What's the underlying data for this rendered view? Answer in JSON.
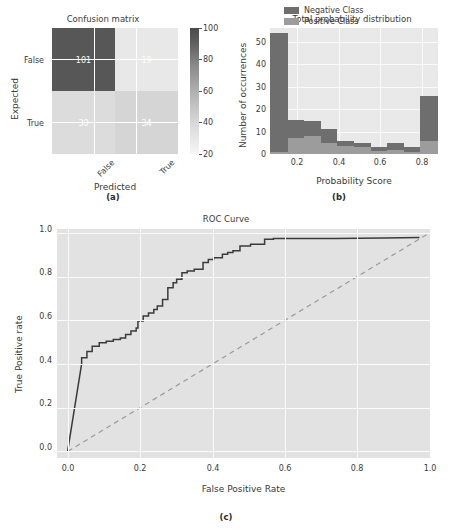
{
  "figure": {
    "captions": {
      "a": "(a)",
      "b": "(b)",
      "c": "(c)"
    }
  },
  "chart_data": [
    {
      "type": "heatmap",
      "panel": "a",
      "title": "Confusion matrix",
      "xlabel": "Predicted",
      "ylabel": "Expected",
      "xticklabels": [
        "False",
        "True"
      ],
      "yticklabels": [
        "False",
        "True"
      ],
      "matrix": [
        [
          101,
          19
        ],
        [
          30,
          34
        ]
      ],
      "cells": [
        {
          "row": "False",
          "col": "False",
          "value": 101,
          "color": "#575757"
        },
        {
          "row": "False",
          "col": "True",
          "value": 19,
          "color": "#e8e8e8"
        },
        {
          "row": "True",
          "col": "False",
          "value": 30,
          "color": "#dcdcdc"
        },
        {
          "row": "True",
          "col": "True",
          "value": 34,
          "color": "#d5d5d5"
        }
      ],
      "colorbar": {
        "ticks": [
          20,
          40,
          60,
          80,
          100
        ],
        "ticklabels": [
          "20",
          "40",
          "60",
          "80",
          "100"
        ],
        "vmin": 20,
        "vmax": 100
      },
      "grid": true
    },
    {
      "type": "bar",
      "panel": "b",
      "title": "Total probability distribution",
      "xlabel": "Probability Score",
      "ylabel": "Number of occurrences",
      "xticklabels": [
        "0.2",
        "0.4",
        "0.6",
        "0.8"
      ],
      "xticks": [
        0.2,
        0.4,
        0.6,
        0.8
      ],
      "yticklabels": [
        "0",
        "10",
        "20",
        "30",
        "40",
        "50"
      ],
      "yticks": [
        0,
        10,
        20,
        30,
        40,
        50
      ],
      "xlim": [
        0.07,
        0.88
      ],
      "ylim": [
        0,
        56
      ],
      "legend": {
        "position": "upper-center",
        "entries": [
          "Negative Class",
          "Positive Class"
        ]
      },
      "bin_edges": [
        0.07,
        0.155,
        0.235,
        0.315,
        0.395,
        0.475,
        0.555,
        0.635,
        0.715,
        0.795,
        0.88
      ],
      "series": [
        {
          "name": "Negative Class",
          "color": "#6e6e6e",
          "values": [
            54,
            15,
            14.5,
            11,
            6,
            5,
            3,
            5,
            3,
            26
          ]
        },
        {
          "name": "Positive Class",
          "color": "#9c9c9c",
          "values": [
            1,
            7,
            8,
            5,
            3.5,
            3,
            1.5,
            2,
            1,
            6
          ]
        }
      ]
    },
    {
      "type": "line",
      "panel": "c",
      "title": "ROC Curve",
      "xlabel": "False Positive Rate",
      "ylabel": "True Positive rate",
      "xticklabels": [
        "0.0",
        "0.2",
        "0.4",
        "0.6",
        "0.8",
        "1.0"
      ],
      "xticks": [
        0.0,
        0.2,
        0.4,
        0.6,
        0.8,
        1.0
      ],
      "yticklabels": [
        "0.0",
        "0.2",
        "0.4",
        "0.6",
        "0.8",
        "1.0"
      ],
      "yticks": [
        0.0,
        0.2,
        0.4,
        0.6,
        0.8,
        1.0
      ],
      "xlim": [
        -0.03,
        1.03
      ],
      "ylim": [
        -0.03,
        1.04
      ],
      "grid": true,
      "series": [
        {
          "name": "ROC",
          "style": "solid",
          "color": "#3b3b3b",
          "points": [
            [
              0.0,
              0.0
            ],
            [
              0.04,
              0.41
            ],
            [
              0.04,
              0.438
            ],
            [
              0.055,
              0.438
            ],
            [
              0.055,
              0.468
            ],
            [
              0.07,
              0.468
            ],
            [
              0.07,
              0.492
            ],
            [
              0.09,
              0.492
            ],
            [
              0.09,
              0.508
            ],
            [
              0.11,
              0.508
            ],
            [
              0.11,
              0.516
            ],
            [
              0.13,
              0.516
            ],
            [
              0.13,
              0.524
            ],
            [
              0.15,
              0.524
            ],
            [
              0.15,
              0.531
            ],
            [
              0.165,
              0.531
            ],
            [
              0.165,
              0.547
            ],
            [
              0.18,
              0.547
            ],
            [
              0.18,
              0.563
            ],
            [
              0.195,
              0.563
            ],
            [
              0.195,
              0.578
            ],
            [
              0.2,
              0.578
            ],
            [
              0.2,
              0.61
            ],
            [
              0.215,
              0.61
            ],
            [
              0.215,
              0.633
            ],
            [
              0.23,
              0.633
            ],
            [
              0.23,
              0.648
            ],
            [
              0.245,
              0.648
            ],
            [
              0.245,
              0.664
            ],
            [
              0.255,
              0.664
            ],
            [
              0.255,
              0.68
            ],
            [
              0.27,
              0.68
            ],
            [
              0.27,
              0.711
            ],
            [
              0.285,
              0.711
            ],
            [
              0.285,
              0.766
            ],
            [
              0.3,
              0.766
            ],
            [
              0.3,
              0.789
            ],
            [
              0.31,
              0.789
            ],
            [
              0.31,
              0.805
            ],
            [
              0.325,
              0.805
            ],
            [
              0.325,
              0.836
            ],
            [
              0.34,
              0.836
            ],
            [
              0.34,
              0.844
            ],
            [
              0.36,
              0.844
            ],
            [
              0.36,
              0.852
            ],
            [
              0.385,
              0.852
            ],
            [
              0.385,
              0.883
            ],
            [
              0.4,
              0.883
            ],
            [
              0.4,
              0.898
            ],
            [
              0.415,
              0.898
            ],
            [
              0.415,
              0.906
            ],
            [
              0.44,
              0.906
            ],
            [
              0.44,
              0.922
            ],
            [
              0.455,
              0.922
            ],
            [
              0.455,
              0.93
            ],
            [
              0.47,
              0.93
            ],
            [
              0.47,
              0.938
            ],
            [
              0.49,
              0.938
            ],
            [
              0.49,
              0.961
            ],
            [
              0.52,
              0.961
            ],
            [
              0.52,
              0.969
            ],
            [
              0.56,
              0.969
            ],
            [
              0.56,
              0.992
            ],
            [
              0.585,
              0.992
            ],
            [
              0.585,
              0.996
            ],
            [
              0.76,
              0.996
            ],
            [
              0.9,
              0.998
            ],
            [
              1.0,
              1.0
            ]
          ]
        },
        {
          "name": "Chance",
          "style": "dashed",
          "color": "#9a9a9a",
          "points": [
            [
              0.0,
              0.0
            ],
            [
              1.0,
              1.0
            ]
          ]
        }
      ]
    }
  ]
}
